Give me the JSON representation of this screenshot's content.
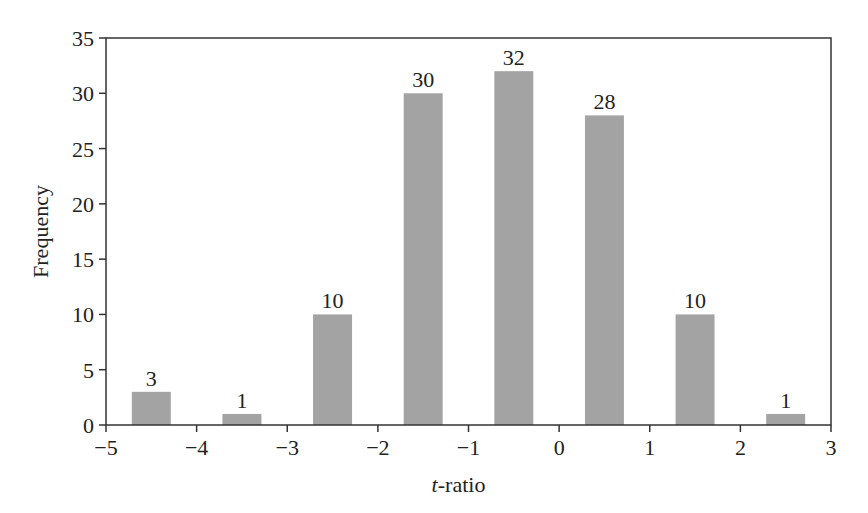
{
  "chart_data": {
    "type": "bar",
    "title": "",
    "xlabel_italic": "t",
    "xlabel_rest": "-ratio",
    "xlabel": "t-ratio",
    "ylabel": "Frequency",
    "bin_edges": [
      -5,
      -4,
      -3,
      -2,
      -1,
      0,
      1,
      2,
      3
    ],
    "x": [
      -4.5,
      -3.5,
      -2.5,
      -1.5,
      -0.5,
      0.5,
      1.5,
      2.5
    ],
    "values": [
      3,
      1,
      10,
      30,
      32,
      28,
      10,
      1
    ],
    "data_labels": [
      "3",
      "1",
      "10",
      "30",
      "32",
      "28",
      "10",
      "1"
    ],
    "xlim": [
      -5,
      3
    ],
    "ylim": [
      0,
      35
    ],
    "xticks": [
      -5,
      -4,
      -3,
      -2,
      -1,
      0,
      1,
      2,
      3
    ],
    "xtick_labels": [
      "−5",
      "−4",
      "−3",
      "−2",
      "−1",
      "0",
      "1",
      "2",
      "3"
    ],
    "yticks": [
      0,
      5,
      10,
      15,
      20,
      25,
      30,
      35
    ],
    "ytick_labels": [
      "0",
      "5",
      "10",
      "15",
      "20",
      "25",
      "30",
      "35"
    ],
    "grid": false,
    "legend": null,
    "bar_color": "#a3a3a3",
    "bar_width": 0.43
  }
}
